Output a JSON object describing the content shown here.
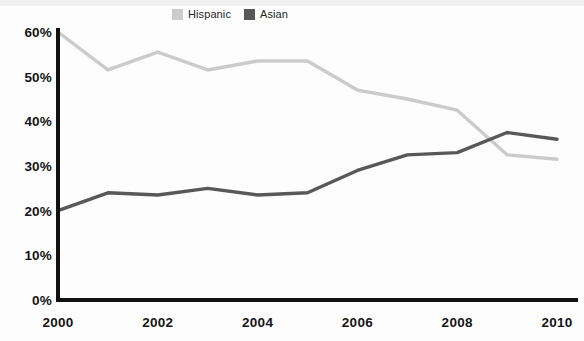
{
  "chart_data": {
    "type": "line",
    "title": "",
    "xlabel": "",
    "ylabel": "",
    "x": [
      2000,
      2001,
      2002,
      2003,
      2004,
      2005,
      2006,
      2007,
      2008,
      2009,
      2010
    ],
    "xtick_labels": [
      "2000",
      "2002",
      "2004",
      "2006",
      "2008",
      "2010"
    ],
    "xtick_values": [
      2000,
      2002,
      2004,
      2006,
      2008,
      2010
    ],
    "ytick_labels": [
      "0%",
      "10%",
      "20%",
      "30%",
      "40%",
      "50%",
      "60%"
    ],
    "ytick_values": [
      0,
      10,
      20,
      30,
      40,
      50,
      60
    ],
    "ylim": [
      0,
      60
    ],
    "xlim": [
      2000,
      2010
    ],
    "grid": false,
    "legend_position": "top-center",
    "series": [
      {
        "name": "Hispanic",
        "color": "#cbcbcb",
        "values": [
          60,
          51.5,
          55.5,
          51.5,
          53.5,
          53.5,
          47,
          45,
          42.5,
          32.5,
          31.5
        ]
      },
      {
        "name": "Asian",
        "color": "#585858",
        "values": [
          20,
          24,
          23.5,
          25,
          23.5,
          24,
          29,
          32.5,
          33,
          37.5,
          36
        ]
      }
    ],
    "axis_color": "#111111"
  }
}
